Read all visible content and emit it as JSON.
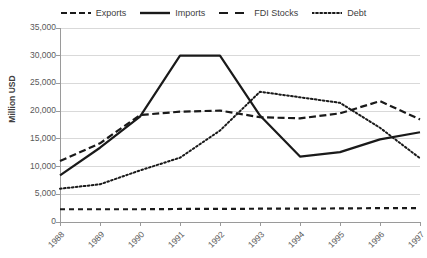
{
  "chart_data": {
    "type": "line",
    "title": "",
    "xlabel": "",
    "ylabel": "Million USD",
    "categories": [
      "1988",
      "1989",
      "1990",
      "1991",
      "1992",
      "1993",
      "1994",
      "1995",
      "1996",
      "1997"
    ],
    "ylim": [
      0,
      35000
    ],
    "ytick_values": [
      0,
      5000,
      10000,
      15000,
      20000,
      25000,
      30000,
      35000
    ],
    "ytick_labels": [
      "0",
      "5,000",
      "10,000",
      "15,000",
      "20,000",
      "25,000",
      "30,000",
      "35,000"
    ],
    "grid": "horizontal",
    "legend_position": "top",
    "series": [
      {
        "name": "Exports",
        "style": "dashed",
        "color": "#1a1a1a",
        "values": [
          11000,
          14200,
          19300,
          19900,
          20100,
          18900,
          18700,
          19600,
          21800,
          18500
        ]
      },
      {
        "name": "Imports",
        "style": "solid",
        "color": "#1a1a1a",
        "values": [
          8400,
          13400,
          19000,
          30000,
          30000,
          19200,
          11800,
          12600,
          14900,
          16200
        ]
      },
      {
        "name": "FDI Stocks",
        "style": "longdash",
        "color": "#1a1a1a",
        "values": [
          2300,
          2300,
          2300,
          2350,
          2350,
          2400,
          2400,
          2450,
          2500,
          2500
        ]
      },
      {
        "name": "Debt",
        "style": "dotted",
        "color": "#1a1a1a",
        "values": [
          6000,
          6800,
          9300,
          11600,
          16500,
          23500,
          22500,
          21500,
          17000,
          11500
        ]
      }
    ]
  },
  "legend": {
    "entries": [
      {
        "label": "Exports",
        "icon": "dashed-line-icon"
      },
      {
        "label": "Imports",
        "icon": "solid-line-icon"
      },
      {
        "label": "FDI Stocks",
        "icon": "longdash-line-icon"
      },
      {
        "label": "Debt",
        "icon": "dotted-line-icon"
      }
    ]
  }
}
